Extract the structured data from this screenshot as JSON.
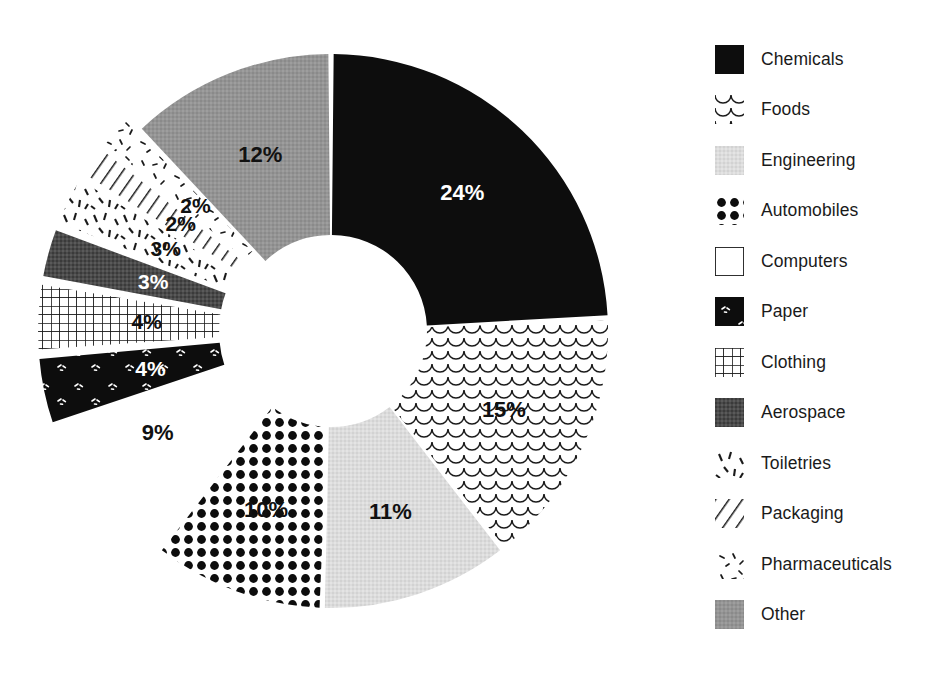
{
  "chart_data": {
    "type": "pie",
    "variant": "donut",
    "title": "",
    "subtitle": "",
    "xlabel": "",
    "ylabel": "",
    "legend_position": "right",
    "grid": false,
    "value_suffix": "%",
    "start_angle_deg": 0,
    "categories": [
      "Chemicals",
      "Foods",
      "Engineering",
      "Automobiles",
      "Computers",
      "Paper",
      "Clothing",
      "Aerospace",
      "Toiletries",
      "Packaging",
      "Pharmaceuticals",
      "Other"
    ],
    "values": [
      24,
      15,
      11,
      10,
      9,
      4,
      4,
      3,
      3,
      2,
      2,
      12
    ],
    "labels": [
      "24%",
      "15%",
      "11%",
      "10%",
      "9%",
      "4%",
      "4%",
      "3%",
      "3%",
      "2%",
      "2%",
      "12%"
    ],
    "slices": [
      {
        "name": "Chemicals",
        "value": 24,
        "label": "24%",
        "fill": "solid-black",
        "color": "#0d0d0d",
        "label_color": "#ffffff",
        "exploded": false,
        "label_outside": false
      },
      {
        "name": "Foods",
        "value": 15,
        "label": "15%",
        "fill": "fish-scale",
        "color": "#ffffff",
        "label_color": "#111111",
        "exploded": false,
        "label_outside": false
      },
      {
        "name": "Engineering",
        "value": 11,
        "label": "11%",
        "fill": "light-gray",
        "color": "#d8d8d8",
        "label_color": "#111111",
        "exploded": false,
        "label_outside": false
      },
      {
        "name": "Automobiles",
        "value": 10,
        "label": "10%",
        "fill": "dots",
        "color": "#ffffff",
        "label_color": "#111111",
        "exploded": false,
        "label_outside": false
      },
      {
        "name": "Computers",
        "value": 9,
        "label": "9%",
        "fill": "white",
        "color": "#ffffff",
        "label_color": "#111111",
        "exploded": false,
        "label_outside": true
      },
      {
        "name": "Paper",
        "value": 4,
        "label": "4%",
        "fill": "black-flecks",
        "color": "#0d0d0d",
        "label_color": "#ffffff",
        "exploded": true,
        "label_outside": false
      },
      {
        "name": "Clothing",
        "value": 4,
        "label": "4%",
        "fill": "grid",
        "color": "#ffffff",
        "label_color": "#111111",
        "exploded": true,
        "label_outside": false
      },
      {
        "name": "Aerospace",
        "value": 3,
        "label": "3%",
        "fill": "dark-gray",
        "color": "#4a4a4a",
        "label_color": "#ffffff",
        "exploded": true,
        "label_outside": false
      },
      {
        "name": "Toiletries",
        "value": 3,
        "label": "3%",
        "fill": "dashes",
        "color": "#ffffff",
        "label_color": "#111111",
        "exploded": true,
        "label_outside": false
      },
      {
        "name": "Packaging",
        "value": 2,
        "label": "2%",
        "fill": "diagonal-hatch",
        "color": "#ffffff",
        "label_color": "#111111",
        "exploded": true,
        "label_outside": false
      },
      {
        "name": "Pharmaceuticals",
        "value": 2,
        "label": "2%",
        "fill": "speckles",
        "color": "#ffffff",
        "label_color": "#111111",
        "exploded": true,
        "label_outside": false
      },
      {
        "name": "Other",
        "value": 12,
        "label": "12%",
        "fill": "medium-gray",
        "color": "#919191",
        "label_color": "#111111",
        "exploded": false,
        "label_outside": false
      }
    ]
  },
  "legend": {
    "items": [
      {
        "label": "Chemicals",
        "swatch": "solid-black-swatch"
      },
      {
        "label": "Foods",
        "swatch": "fish-scale-swatch"
      },
      {
        "label": "Engineering",
        "swatch": "light-gray-swatch"
      },
      {
        "label": "Automobiles",
        "swatch": "dots-swatch"
      },
      {
        "label": "Computers",
        "swatch": "white-outline-swatch"
      },
      {
        "label": "Paper",
        "swatch": "black-flecks-swatch"
      },
      {
        "label": "Clothing",
        "swatch": "grid-swatch"
      },
      {
        "label": "Aerospace",
        "swatch": "dark-gray-swatch"
      },
      {
        "label": "Toiletries",
        "swatch": "dashes-swatch"
      },
      {
        "label": "Packaging",
        "swatch": "diagonal-hatch-swatch"
      },
      {
        "label": "Pharmaceuticals",
        "swatch": "speckles-swatch"
      },
      {
        "label": "Other",
        "swatch": "medium-gray-swatch"
      }
    ]
  }
}
